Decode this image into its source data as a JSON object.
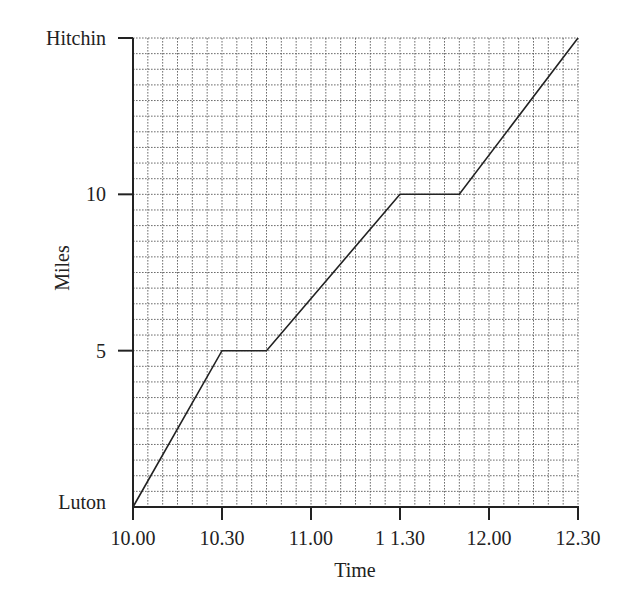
{
  "chart_data": {
    "type": "line",
    "title": "",
    "xlabel": "Time",
    "ylabel": "Miles",
    "x_ticks": [
      "10.00",
      "10.30",
      "11.00",
      "1 1.30",
      "12.00",
      "12.30"
    ],
    "x_tick_minutes": [
      0,
      30,
      60,
      90,
      120,
      150
    ],
    "y_ticks": [
      {
        "value": 0,
        "label": "Luton",
        "tick": false
      },
      {
        "value": 5,
        "label": "5",
        "tick": true
      },
      {
        "value": 10,
        "label": "10",
        "tick": true
      },
      {
        "value": 15,
        "label": "Hitchin",
        "tick": true
      }
    ],
    "xlim_minutes": [
      0,
      150
    ],
    "ylim": [
      0,
      15
    ],
    "grid": {
      "on": true,
      "x_step_minutes": 5,
      "y_step_miles": 0.5,
      "style": "dotted"
    },
    "legend": null,
    "series": [
      {
        "name": "Journey Luton to Hitchin",
        "x": [
          "10.00",
          "10.30",
          "10.45",
          "11.30",
          "11.50",
          "12.30"
        ],
        "x_minutes": [
          0,
          30,
          45,
          90,
          110,
          150
        ],
        "values": [
          0,
          5,
          5,
          10,
          10,
          15
        ]
      }
    ]
  },
  "colors": {
    "line": "#222222",
    "grid": "#555555",
    "background": "#ffffff"
  }
}
